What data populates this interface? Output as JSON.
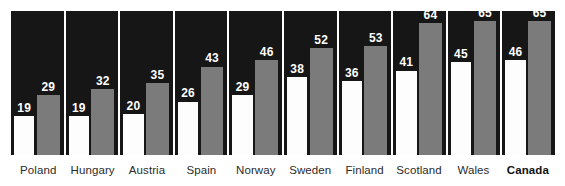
{
  "chart_data": {
    "type": "bar",
    "title": "",
    "subtitle": "",
    "xlabel": "",
    "ylabel": "",
    "ylim": [
      0,
      72
    ],
    "grid": false,
    "legend_position": "none",
    "categories": [
      "Poland",
      "Hungary",
      "Austria",
      "Spain",
      "Norway",
      "Sweden",
      "Finland",
      "Scotland",
      "Wales",
      "Canada"
    ],
    "series": [
      {
        "name": "series-a",
        "color": "#fdfdfd",
        "values": [
          19,
          19,
          20,
          26,
          29,
          38,
          36,
          41,
          45,
          46
        ]
      },
      {
        "name": "series-b",
        "color": "#7b7b7b",
        "values": [
          29,
          32,
          35,
          43,
          46,
          52,
          53,
          64,
          65,
          65
        ]
      }
    ],
    "panel_background": "#161616",
    "highlight_category": "Canada"
  },
  "panels": [
    {
      "label": "Poland",
      "highlight": false,
      "a_value": "19",
      "b_value": "29",
      "a_height_pct": 27.1,
      "b_height_pct": 41.4,
      "a_label_bottom_pct": 27.9,
      "b_label_bottom_pct": 42.2
    },
    {
      "label": "Hungary",
      "highlight": false,
      "a_value": "19",
      "b_value": "32",
      "a_height_pct": 27.1,
      "b_height_pct": 45.7,
      "a_label_bottom_pct": 27.9,
      "b_label_bottom_pct": 46.5
    },
    {
      "label": "Austria",
      "highlight": false,
      "a_value": "20",
      "b_value": "35",
      "a_height_pct": 28.6,
      "b_height_pct": 50.0,
      "a_label_bottom_pct": 29.4,
      "b_label_bottom_pct": 50.8
    },
    {
      "label": "Spain",
      "highlight": false,
      "a_value": "26",
      "b_value": "43",
      "a_height_pct": 37.1,
      "b_height_pct": 61.4,
      "a_label_bottom_pct": 37.9,
      "b_label_bottom_pct": 62.2
    },
    {
      "label": "Norway",
      "highlight": false,
      "a_value": "29",
      "b_value": "46",
      "a_height_pct": 41.4,
      "b_height_pct": 65.7,
      "a_label_bottom_pct": 42.2,
      "b_label_bottom_pct": 66.5
    },
    {
      "label": "Sweden",
      "highlight": false,
      "a_value": "38",
      "b_value": "52",
      "a_height_pct": 54.3,
      "b_height_pct": 74.3,
      "a_label_bottom_pct": 55.1,
      "b_label_bottom_pct": 75.1
    },
    {
      "label": "Finland",
      "highlight": false,
      "a_value": "36",
      "b_value": "53",
      "a_height_pct": 51.4,
      "b_height_pct": 75.7,
      "a_label_bottom_pct": 52.2,
      "b_label_bottom_pct": 76.5
    },
    {
      "label": "Scotland",
      "highlight": false,
      "a_value": "41",
      "b_value": "64",
      "a_height_pct": 58.6,
      "b_height_pct": 91.4,
      "a_label_bottom_pct": 59.4,
      "b_label_bottom_pct": 92.2
    },
    {
      "label": "Wales",
      "highlight": false,
      "a_value": "45",
      "b_value": "65",
      "a_height_pct": 64.3,
      "b_height_pct": 92.9,
      "a_label_bottom_pct": 65.1,
      "b_label_bottom_pct": 93.7
    },
    {
      "label": "Canada",
      "highlight": true,
      "a_value": "46",
      "b_value": "65",
      "a_height_pct": 65.7,
      "b_height_pct": 92.9,
      "a_label_bottom_pct": 66.5,
      "b_label_bottom_pct": 93.7
    }
  ]
}
